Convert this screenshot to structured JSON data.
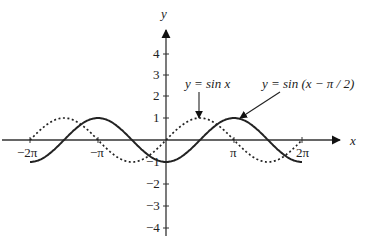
{
  "chart_data": {
    "type": "line",
    "title": "",
    "xlabel": "x",
    "ylabel": "y",
    "xlim": [
      -6.6,
      7.2
    ],
    "ylim": [
      -4,
      4.8
    ],
    "x_ticks": [
      "-2π",
      "-π",
      "π",
      "2π"
    ],
    "y_ticks": [
      "4",
      "3",
      "2",
      "1",
      "-1",
      "-2",
      "-3",
      "-4"
    ],
    "grid": false,
    "series": [
      {
        "name": "y = sin x",
        "style": "dotted",
        "function": "sin(x)",
        "domain": [
          -6.283,
          6.283
        ]
      },
      {
        "name": "y = sin (x − π / 2)",
        "style": "solid",
        "function": "sin(x - pi/2)",
        "domain": [
          -6.283,
          6.283
        ]
      }
    ],
    "annotations": [
      {
        "text": "y = sin x",
        "points_to": "peak of sin x at x=π/2"
      },
      {
        "text": "y = sin (x − π / 2)",
        "points_to": "peak of shifted curve at x=π"
      }
    ]
  },
  "labels": {
    "x_axis": "x",
    "y_axis": "y",
    "neg2pi": "−2π",
    "negpi": "−π",
    "pi": "π",
    "twopi": "2π",
    "y4": "4",
    "y3": "3",
    "y2": "2",
    "y1": "1",
    "yn1": "−1",
    "yn2": "−2",
    "yn3": "−3",
    "yn4": "−4",
    "sin_label": "y = sin  x",
    "shift_label": "y = sin (x − π / 2)"
  }
}
